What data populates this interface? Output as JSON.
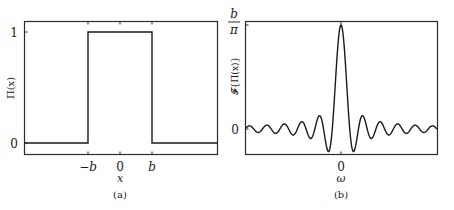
{
  "chart_data": [
    {
      "type": "line",
      "panel_label": "(a)",
      "title": "",
      "xlabel": "x",
      "ylabel": "Π(x)",
      "x_ticks": [
        "−b",
        "0",
        "b"
      ],
      "y_ticks": [
        "0",
        "1"
      ],
      "grid": false,
      "legend": null,
      "description": "Rectangular (box) function: 0 for |x| > b, 1 for |x| < b",
      "x": [
        "-2.5b",
        "-b",
        "-b",
        "b",
        "b",
        "2.5b"
      ],
      "y": [
        0,
        0,
        1,
        1,
        0,
        0
      ],
      "ylim": [
        -0.1,
        1.1
      ]
    },
    {
      "type": "line",
      "panel_label": "(b)",
      "title": "",
      "xlabel": "ω",
      "ylabel": "𝓕{Π(x)}",
      "x_ticks": [
        "0"
      ],
      "y_ticks": [
        "0",
        "b/π"
      ],
      "grid": false,
      "legend": null,
      "description": "Sinc-shaped Fourier transform: peak b/π at ω=0 with decaying oscillations about 0",
      "peak": {
        "x": 0,
        "y": "b/π"
      },
      "ylim": [
        "-0.25·b/π",
        "b/π"
      ]
    }
  ],
  "panels": {
    "a": {
      "caption": "(a)",
      "ylabel": "Π(x)",
      "xlabel": "x",
      "xticks": {
        "neg_b": "−b",
        "zero": "0",
        "b": "b"
      },
      "yticks": {
        "zero": "0",
        "one": "1"
      }
    },
    "b": {
      "caption": "(b)",
      "ylabel": "𝓕{Π(x)}",
      "xlabel": "ω",
      "xticks": {
        "zero": "0"
      },
      "yticks": {
        "zero": "0",
        "top_num": "b",
        "top_den": "π"
      }
    }
  }
}
